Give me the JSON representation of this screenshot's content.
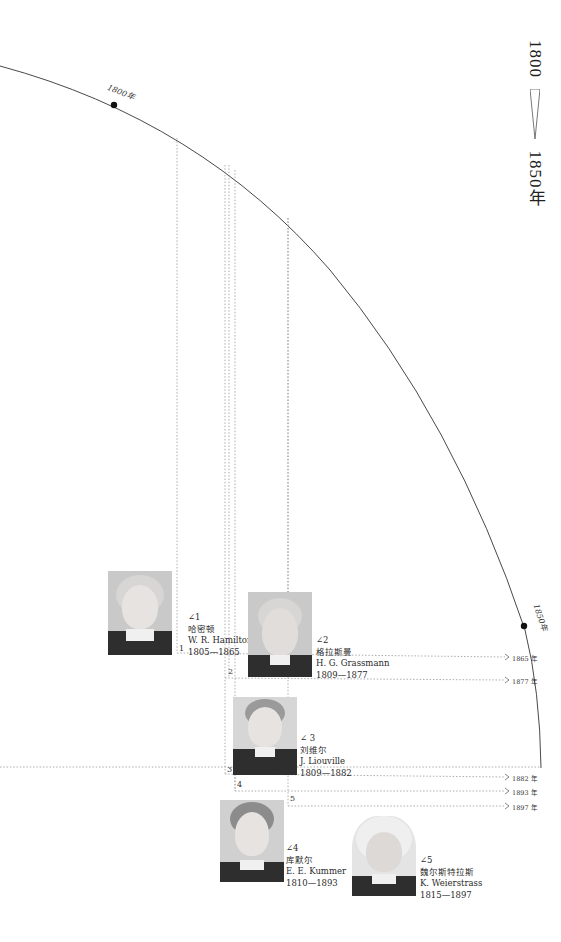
{
  "title": {
    "start": "1800",
    "end": "1850年"
  },
  "arc_labels": {
    "y1800": "1800年",
    "y1850": "1850年"
  },
  "mathematicians": [
    {
      "index": "1",
      "angle_label": "∠1",
      "name_cn": "哈密顿",
      "name_en": "W. R. Hamilton",
      "years": "1805—1865",
      "end_year": "1865 年"
    },
    {
      "index": "2",
      "angle_label": "∠2",
      "name_cn": "格拉斯曼",
      "name_en": "H. G. Grassmann",
      "years": "1809—1877",
      "end_year": "1877 年"
    },
    {
      "index": "3",
      "angle_label": "∠ 3",
      "name_cn": "刘维尔",
      "name_en": "J. Liouville",
      "years": "1809—1882",
      "end_year": "1882 年"
    },
    {
      "index": "4",
      "angle_label": "∠4",
      "name_cn": "库默尔",
      "name_en": "E. E. Kummer",
      "years": "1810—1893",
      "end_year": "1893 年"
    },
    {
      "index": "5",
      "angle_label": "∠5",
      "name_cn": "魏尔斯特拉斯",
      "name_en": "K. Weierstrass",
      "years": "1815—1897",
      "end_year": "1897 年"
    }
  ],
  "colors": {
    "line": "#333333",
    "dotted": "#8a8a8a",
    "text": "#222222"
  }
}
